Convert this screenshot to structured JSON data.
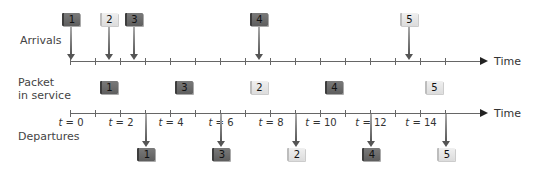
{
  "labels": {
    "arrivals": "Arrivals",
    "packet_in_service_line1": "Packet",
    "packet_in_service_line2": "in service",
    "departures": "Departures",
    "time_top": "Time",
    "time_bottom": "Time"
  },
  "axis": {
    "t0_x": 70,
    "px_per_unit": 25,
    "tick_count": 16,
    "tick_labels": [
      {
        "t": 0,
        "text": "t = 0"
      },
      {
        "t": 2,
        "text": "t = 2"
      },
      {
        "t": 4,
        "text": "t = 4"
      },
      {
        "t": 6,
        "text": "t = 6"
      },
      {
        "t": 8,
        "text": "t = 8"
      },
      {
        "t": 10,
        "text": "t = 10"
      },
      {
        "t": 12,
        "text": "t = 12"
      },
      {
        "t": 14,
        "text": "t = 14"
      }
    ]
  },
  "colors": {
    "dark_packet": "#6b6b6b",
    "light_packet": "#e6e6e6",
    "axis": "#666666"
  },
  "arrivals": [
    {
      "id": "1",
      "t": 0.0,
      "shade": "dark"
    },
    {
      "id": "2",
      "t": 1.5,
      "shade": "light"
    },
    {
      "id": "3",
      "t": 2.5,
      "shade": "dark"
    },
    {
      "id": "4",
      "t": 7.5,
      "shade": "dark"
    },
    {
      "id": "5",
      "t": 13.5,
      "shade": "light"
    }
  ],
  "in_service": [
    {
      "id": "1",
      "start": 1,
      "shade": "dark"
    },
    {
      "id": "3",
      "start": 4,
      "shade": "dark"
    },
    {
      "id": "2",
      "start": 7,
      "shade": "light"
    },
    {
      "id": "4",
      "start": 10,
      "shade": "dark"
    },
    {
      "id": "5",
      "start": 14,
      "shade": "light"
    }
  ],
  "departures": [
    {
      "id": "1",
      "t": 3,
      "shade": "dark"
    },
    {
      "id": "3",
      "t": 6,
      "shade": "dark"
    },
    {
      "id": "2",
      "t": 9,
      "shade": "light"
    },
    {
      "id": "4",
      "t": 12,
      "shade": "dark"
    },
    {
      "id": "5",
      "t": 15,
      "shade": "light"
    }
  ]
}
